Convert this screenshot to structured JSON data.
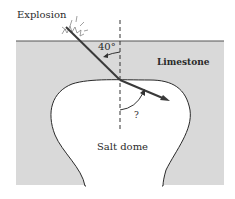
{
  "diagram": {
    "labels": {
      "explosion": "Explosion",
      "angle": "40°",
      "limestone": "Limestone",
      "unknown_angle": "?",
      "salt_dome": "Salt dome"
    },
    "colors": {
      "limestone_fill": "#d9d9d9",
      "salt_dome_fill": "#ffffff",
      "ray": "#3a3a3a",
      "outline": "#2a2a2a"
    },
    "incident_angle_deg": 40
  }
}
